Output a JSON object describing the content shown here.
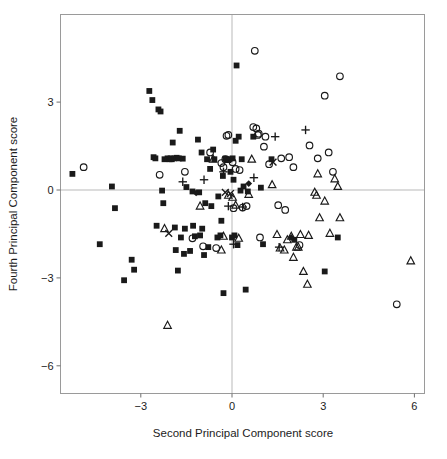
{
  "figure": {
    "background": "#ffffff",
    "frame_color": "#9a9a9a",
    "marker_color": "#1a1a1a"
  },
  "chart_data": {
    "type": "scatter",
    "title": "",
    "xlabel": "Second Principal Component score",
    "ylabel": "Fourth Principal Component score",
    "xlim": [
      -5.65,
      6.35
    ],
    "ylim": [
      -7.0,
      5.35
    ],
    "xticks": [
      -3,
      0,
      3,
      6
    ],
    "xtick_labels": [
      "−3",
      "0",
      "3",
      "6"
    ],
    "yticks": [
      3,
      0,
      -3,
      -6
    ],
    "ytick_labels": [
      "3",
      "0",
      "−3",
      "−6"
    ],
    "grid": false,
    "zero_lines": {
      "x": 0,
      "y": 0,
      "color": "#b9b9b9"
    },
    "legend": null,
    "marker_styles": {
      "square": "filled-square",
      "circle": "open-circle",
      "triangle": "open-triangle",
      "plus": "plus",
      "cross": "cross",
      "diamond": "filled-diamond"
    },
    "series": [
      {
        "name": "filled-square",
        "marker": "square",
        "points": [
          [
            -5.25,
            0.55
          ],
          [
            -4.35,
            -1.85
          ],
          [
            -3.95,
            0.12
          ],
          [
            -3.85,
            -0.62
          ],
          [
            -3.55,
            -3.08
          ],
          [
            -3.3,
            -2.38
          ],
          [
            -3.22,
            -2.72
          ],
          [
            -2.72,
            3.38
          ],
          [
            -2.62,
            3.07
          ],
          [
            -2.58,
            1.12
          ],
          [
            -2.52,
            1.08
          ],
          [
            -2.48,
            -1.22
          ],
          [
            -2.42,
            2.75
          ],
          [
            -2.35,
            2.68
          ],
          [
            -2.3,
            -0.02
          ],
          [
            -2.26,
            -0.45
          ],
          [
            -2.22,
            1.05
          ],
          [
            -2.12,
            1.08
          ],
          [
            -2.05,
            1.05
          ],
          [
            -2.02,
            1.08
          ],
          [
            -1.98,
            1.05
          ],
          [
            -1.95,
            1.62
          ],
          [
            -1.9,
            1.08
          ],
          [
            -1.88,
            -1.28
          ],
          [
            -1.85,
            -2.05
          ],
          [
            -1.82,
            1.1
          ],
          [
            -1.78,
            -2.75
          ],
          [
            -1.75,
            1.08
          ],
          [
            -1.72,
            2.02
          ],
          [
            -1.68,
            -1.62
          ],
          [
            -1.62,
            1.07
          ],
          [
            -1.58,
            -2.18
          ],
          [
            -1.55,
            -1.32
          ],
          [
            -1.5,
            0.1
          ],
          [
            -1.38,
            -2.08
          ],
          [
            -1.3,
            -0.05
          ],
          [
            -1.28,
            -1.22
          ],
          [
            -1.22,
            -1.58
          ],
          [
            -1.12,
            1.72
          ],
          [
            -1.08,
            -0.08
          ],
          [
            -1.05,
            -1.55
          ],
          [
            -0.98,
            -1.32
          ],
          [
            -1.0,
            1.28
          ],
          [
            -0.92,
            -2.22
          ],
          [
            -0.88,
            -0.45
          ],
          [
            -0.82,
            1.05
          ],
          [
            -0.78,
            -1.95
          ],
          [
            -0.72,
            0.72
          ],
          [
            -0.68,
            -0.55
          ],
          [
            -0.62,
            1.38
          ],
          [
            -0.58,
            1.05
          ],
          [
            -0.48,
            -1.62
          ],
          [
            -0.45,
            -0.22
          ],
          [
            -0.38,
            -1.55
          ],
          [
            -0.35,
            -1.05
          ],
          [
            -0.3,
            0.48
          ],
          [
            -0.28,
            -3.52
          ],
          [
            -0.22,
            1.07
          ],
          [
            -0.18,
            1.05
          ],
          [
            -0.12,
            1.02
          ],
          [
            -0.08,
            1.05
          ],
          [
            -0.05,
            0.62
          ],
          [
            0.0,
            -1.62
          ],
          [
            0.02,
            1.08
          ],
          [
            0.05,
            0.35
          ],
          [
            0.08,
            -1.55
          ],
          [
            0.12,
            1.68
          ],
          [
            0.15,
            4.25
          ],
          [
            0.18,
            -1.88
          ],
          [
            0.22,
            1.82
          ],
          [
            0.28,
            -0.02
          ],
          [
            0.32,
            1.05
          ],
          [
            0.38,
            0.12
          ],
          [
            0.45,
            -3.4
          ],
          [
            0.52,
            -0.05
          ],
          [
            0.7,
            1.82
          ],
          [
            0.95,
            0.08
          ],
          [
            1.02,
            -1.85
          ],
          [
            1.3,
            1.05
          ],
          [
            2.05,
            -1.7
          ],
          [
            3.05,
            -2.78
          ],
          [
            3.48,
            -1.62
          ]
        ]
      },
      {
        "name": "open-circle",
        "marker": "circle",
        "points": [
          [
            -4.88,
            0.78
          ],
          [
            -2.38,
            0.52
          ],
          [
            -1.55,
            0.62
          ],
          [
            -1.3,
            -1.65
          ],
          [
            -0.95,
            -1.92
          ],
          [
            -0.72,
            1.28
          ],
          [
            -0.52,
            -1.98
          ],
          [
            -0.35,
            0.92
          ],
          [
            -0.28,
            0.78
          ],
          [
            -0.22,
            1.05
          ],
          [
            -0.18,
            1.85
          ],
          [
            -0.12,
            1.88
          ],
          [
            0.02,
            0.95
          ],
          [
            0.05,
            -0.62
          ],
          [
            0.12,
            0.72
          ],
          [
            0.25,
            0.68
          ],
          [
            0.35,
            -0.6
          ],
          [
            0.48,
            -0.55
          ],
          [
            0.7,
            2.15
          ],
          [
            0.75,
            4.75
          ],
          [
            0.8,
            2.1
          ],
          [
            0.85,
            1.88
          ],
          [
            0.88,
            1.92
          ],
          [
            0.92,
            -1.62
          ],
          [
            1.05,
            1.48
          ],
          [
            1.1,
            1.82
          ],
          [
            1.22,
            0.88
          ],
          [
            1.52,
            -0.52
          ],
          [
            1.62,
            1.08
          ],
          [
            1.75,
            -0.68
          ],
          [
            1.88,
            1.12
          ],
          [
            2.02,
            0.78
          ],
          [
            2.22,
            -1.88
          ],
          [
            2.55,
            1.52
          ],
          [
            2.82,
            1.08
          ],
          [
            3.05,
            3.22
          ],
          [
            3.18,
            1.28
          ],
          [
            3.32,
            0.62
          ],
          [
            3.55,
            3.88
          ],
          [
            5.42,
            -3.9
          ]
        ]
      },
      {
        "name": "open-triangle",
        "marker": "triangle",
        "points": [
          [
            -2.22,
            -1.32
          ],
          [
            -2.12,
            -4.62
          ],
          [
            -1.05,
            -0.55
          ],
          [
            -0.62,
            1.05
          ],
          [
            -0.35,
            -2.05
          ],
          [
            -0.28,
            -1.58
          ],
          [
            -0.12,
            -0.18
          ],
          [
            0.02,
            -0.25
          ],
          [
            0.12,
            -0.52
          ],
          [
            0.22,
            -1.65
          ],
          [
            0.55,
            -0.15
          ],
          [
            0.65,
            1.05
          ],
          [
            1.32,
            0.18
          ],
          [
            1.48,
            -1.52
          ],
          [
            1.58,
            -1.98
          ],
          [
            1.72,
            -2.05
          ],
          [
            1.82,
            -1.7
          ],
          [
            1.95,
            -1.58
          ],
          [
            2.02,
            -2.3
          ],
          [
            2.12,
            -1.95
          ],
          [
            2.18,
            -1.95
          ],
          [
            2.25,
            -1.52
          ],
          [
            2.35,
            -2.78
          ],
          [
            2.48,
            -3.22
          ],
          [
            2.52,
            -1.55
          ],
          [
            2.72,
            -0.08
          ],
          [
            2.78,
            -0.18
          ],
          [
            2.82,
            0.55
          ],
          [
            2.88,
            -0.95
          ],
          [
            3.05,
            -0.38
          ],
          [
            3.22,
            -1.48
          ],
          [
            3.38,
            0.38
          ],
          [
            3.48,
            0.12
          ],
          [
            3.55,
            -0.95
          ],
          [
            5.88,
            -2.42
          ]
        ]
      },
      {
        "name": "plus",
        "marker": "plus",
        "points": [
          [
            -1.62,
            0.28
          ],
          [
            -0.92,
            0.35
          ],
          [
            -0.28,
            0.62
          ],
          [
            -0.12,
            -0.55
          ],
          [
            0.05,
            -1.85
          ],
          [
            0.35,
            -0.58
          ],
          [
            0.72,
            0.42
          ],
          [
            1.42,
            1.82
          ],
          [
            1.55,
            -1.95
          ],
          [
            2.42,
            2.05
          ]
        ]
      },
      {
        "name": "cross",
        "marker": "cross",
        "points": [
          [
            -2.08,
            -1.48
          ],
          [
            -0.22,
            -0.08
          ],
          [
            -0.05,
            -0.12
          ],
          [
            1.35,
            0.95
          ]
        ]
      },
      {
        "name": "filled-diamond",
        "marker": "diamond",
        "points": [
          [
            -1.18,
            -0.1
          ],
          [
            0.55,
            0.22
          ],
          [
            1.95,
            -1.62
          ]
        ]
      }
    ]
  }
}
